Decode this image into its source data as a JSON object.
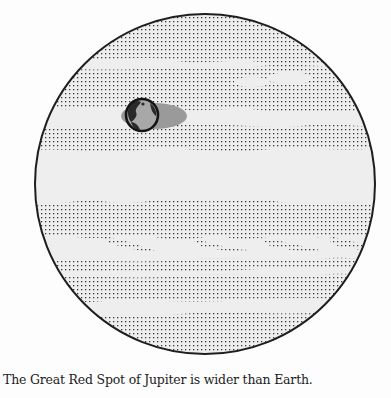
{
  "figure": {
    "subject": "Jupiter",
    "comparison_object": "Earth",
    "feature": "Great Red Spot",
    "colors": {
      "background": "#fdfdfd",
      "planet_fill": "#eeeeee",
      "dots": "#3a3a3a",
      "outline": "#1e1e1e",
      "red_spot": "#9a9a9a",
      "earth_land": "#2a2a2a",
      "earth_ocean": "#a8a8a8"
    }
  },
  "caption": {
    "text": "The Great Red Spot of Jupiter is wider than Earth."
  }
}
